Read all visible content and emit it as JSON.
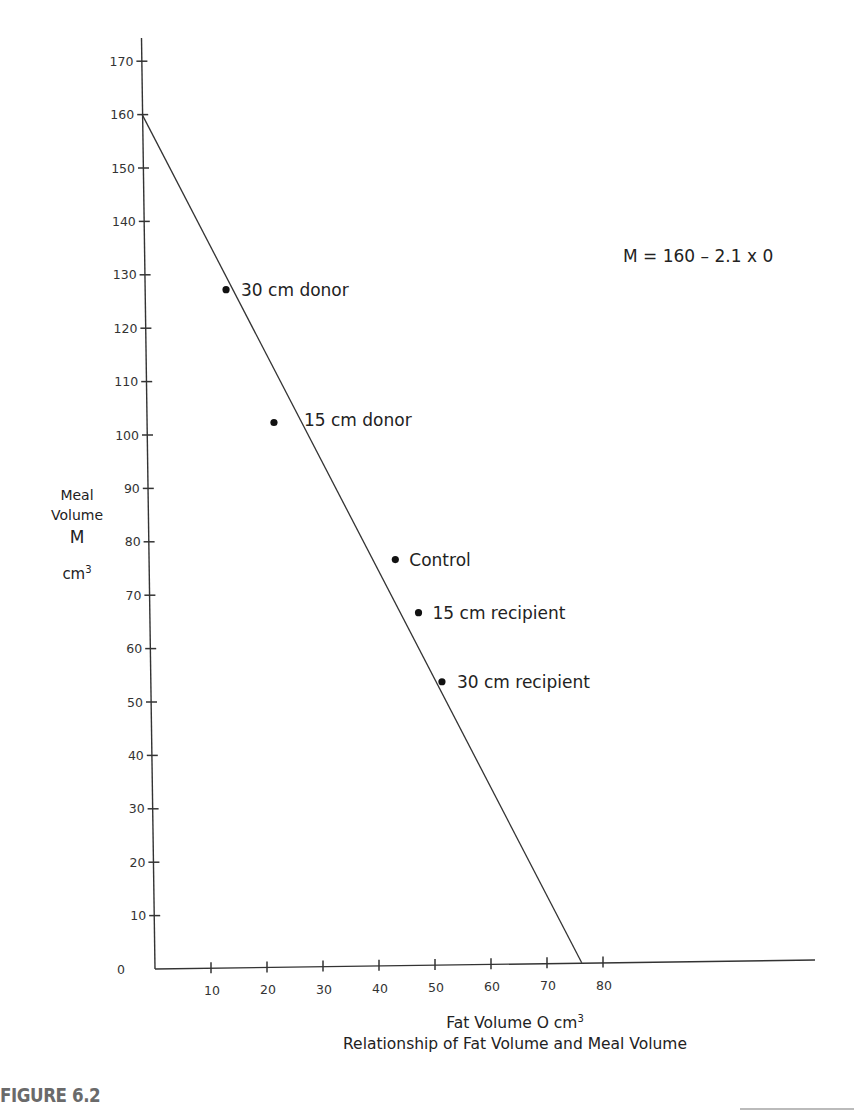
{
  "chart_data": {
    "type": "scatter",
    "title": "Relationship of Fat Volume and Meal Volume",
    "figure_label": "FIGURE 6.2",
    "xlabel": "Fat Volume O cm³",
    "ylabel": "Meal Volume M cm³",
    "xlim": [
      0,
      115
    ],
    "ylim": [
      0,
      175
    ],
    "x_ticks": [
      10,
      20,
      30,
      40,
      50,
      60,
      70,
      80
    ],
    "y_ticks": [
      0,
      10,
      20,
      30,
      40,
      50,
      60,
      70,
      80,
      90,
      100,
      110,
      120,
      130,
      140,
      150,
      160,
      170
    ],
    "grid": false,
    "legend": "none",
    "annotation": "M = 160 – 2.1 x 0",
    "fit_line": {
      "equation": "M = 160 - 2.1 O",
      "intercept": 160,
      "slope": -2.1,
      "x_intercept": 76.2
    },
    "points": [
      {
        "label": "30 cm donor",
        "x": 14.5,
        "y": 127
      },
      {
        "label": "15 cm donor",
        "x": 22.7,
        "y": 102
      },
      {
        "label": "Control",
        "x": 44,
        "y": 76
      },
      {
        "label": "15 cm recipient",
        "x": 48,
        "y": 66
      },
      {
        "label": "30 cm recipient",
        "x": 52,
        "y": 53
      }
    ]
  },
  "labels": {
    "y_axis": {
      "line1": "Meal",
      "line2": "Volume",
      "line3": "M",
      "unit": "cm",
      "unit_sup": "3"
    },
    "x_axis": {
      "text": "Fat Volume O cm",
      "sup": "3"
    },
    "caption": "Relationship of Fat Volume and Meal Volume",
    "equation": "M = 160 – 2.1 x 0",
    "figure": "FIGURE 6.2"
  }
}
